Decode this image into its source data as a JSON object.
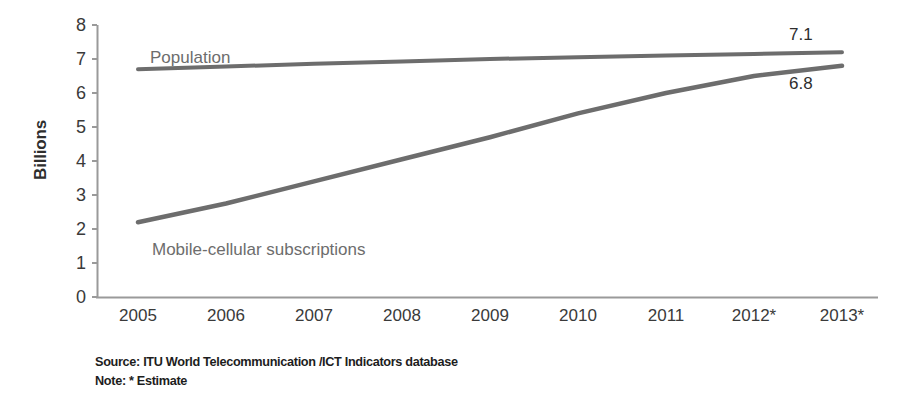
{
  "chart_data": {
    "type": "line",
    "title": "",
    "xlabel": "",
    "ylabel": "Billions",
    "ylim": [
      0,
      8
    ],
    "grid": false,
    "legend_position": "inline-annotation",
    "categories": [
      "2005",
      "2006",
      "2007",
      "2008",
      "2009",
      "2010",
      "2011",
      "2012*",
      "2013*"
    ],
    "x_tick_labels": [
      "2005",
      "2006",
      "2007",
      "2008",
      "2009",
      "2010",
      "2011",
      "2012*",
      "2013*"
    ],
    "y_tick_labels": [
      "8",
      "7",
      "6",
      "5",
      "4",
      "3",
      "2",
      "1",
      "0"
    ],
    "y_ticks": [
      8,
      7,
      6,
      5,
      4,
      3,
      2,
      1,
      0
    ],
    "series": [
      {
        "name": "Population",
        "color": "#6d6d6d",
        "values": [
          6.7,
          6.78,
          6.86,
          6.93,
          7.0,
          7.05,
          7.1,
          7.15,
          7.2
        ],
        "end_label": "7.1"
      },
      {
        "name": "Mobile-cellular subscriptions",
        "color": "#6d6d6d",
        "values": [
          2.2,
          2.75,
          3.4,
          4.05,
          4.7,
          5.4,
          6.0,
          6.5,
          6.8
        ],
        "end_label": "6.8"
      }
    ],
    "annotations": [
      {
        "text": "Population",
        "series": "Population"
      },
      {
        "text": "Mobile-cellular subscriptions",
        "series": "Mobile-cellular subscriptions"
      },
      {
        "text": "7.1",
        "series": "Population"
      },
      {
        "text": "6.8",
        "series": "Mobile-cellular subscriptions"
      }
    ]
  },
  "axis": {
    "y_title": "Billions",
    "y_labels": [
      "8",
      "7",
      "6",
      "5",
      "4",
      "3",
      "2",
      "1",
      "0"
    ],
    "x_labels": [
      "2005",
      "2006",
      "2007",
      "2008",
      "2009",
      "2010",
      "2011",
      "2012*",
      "2013*"
    ]
  },
  "series_labels": {
    "population": "Population",
    "mobile": "Mobile-cellular subscriptions",
    "population_value": "7.1",
    "mobile_value": "6.8"
  },
  "footer": {
    "source": "Source:  ITU World Telecommunication /ICT Indicators database",
    "note": "Note: * Estimate"
  },
  "colors": {
    "line": "#6d6d6d",
    "axis": "#8a8a8a",
    "tick_text": "#3a3a3a",
    "footer_text": "#1d1d1d",
    "background": "#ffffff"
  }
}
